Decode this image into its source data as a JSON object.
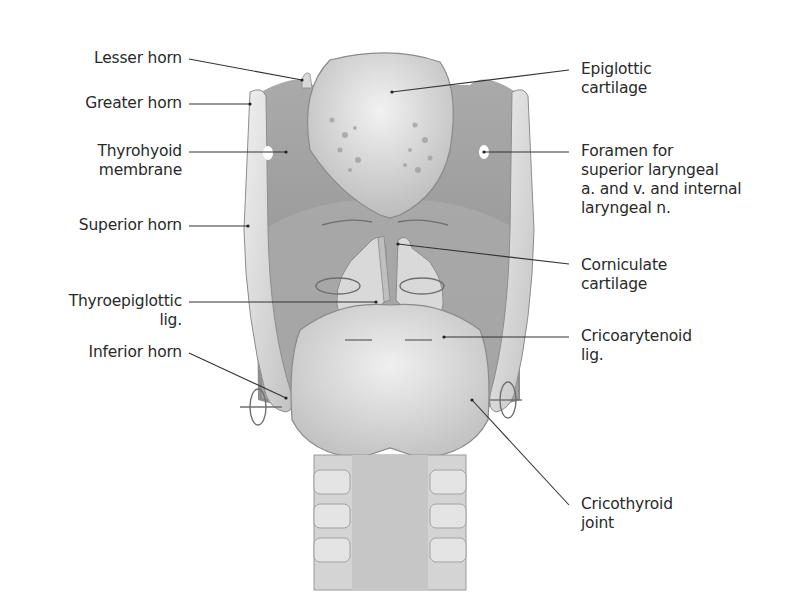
{
  "figure": {
    "colors": {
      "background": "#ffffff",
      "label_text": "#2a2a2a",
      "leader_line": "#333333",
      "cartilage_light": "#e6e6e6",
      "cartilage_mid": "#c4c4c4",
      "membrane_dark": "#9a9a9a",
      "motion_arrow": "#6f6f6f"
    }
  },
  "labels": {
    "left": [
      {
        "id": "lesser-horn",
        "lines": [
          "Lesser horn"
        ]
      },
      {
        "id": "greater-horn",
        "lines": [
          "Greater horn"
        ]
      },
      {
        "id": "thyrohyoid-membrane",
        "lines": [
          "Thyrohyoid",
          "membrane"
        ]
      },
      {
        "id": "superior-horn",
        "lines": [
          "Superior horn"
        ]
      },
      {
        "id": "thyroepiglottic-lig",
        "lines": [
          "Thyroepiglottic",
          "lig."
        ]
      },
      {
        "id": "inferior-horn",
        "lines": [
          "Inferior horn"
        ]
      }
    ],
    "right": [
      {
        "id": "epiglottic-cartilage",
        "lines": [
          "Epiglottic",
          "cartilage"
        ]
      },
      {
        "id": "foramen",
        "lines": [
          "Foramen for",
          "superior laryngeal",
          "a. and v. and internal",
          "laryngeal n."
        ]
      },
      {
        "id": "corniculate-cartilage",
        "lines": [
          "Corniculate",
          "cartilage"
        ]
      },
      {
        "id": "cricoarytenoid-lig",
        "lines": [
          "Cricoarytenoid",
          "lig."
        ]
      },
      {
        "id": "cricothyroid-joint",
        "lines": [
          "Cricothyroid",
          "joint"
        ]
      }
    ]
  }
}
